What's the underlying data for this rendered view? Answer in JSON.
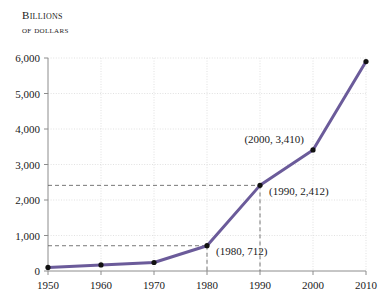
{
  "chart_data": {
    "type": "line",
    "title": "",
    "ylabel_line1": "Billions",
    "ylabel_line2": "of dollars",
    "xlabel": "",
    "x": [
      1950,
      1960,
      1970,
      1980,
      1990,
      2000,
      2010
    ],
    "values": [
      100,
      170,
      240,
      712,
      2412,
      3410,
      5900
    ],
    "series": [
      {
        "name": "Billions of dollars",
        "values": [
          100,
          170,
          240,
          712,
          2412,
          3410,
          5900
        ],
        "color": "#6B5B9A"
      }
    ],
    "x_tick_labels": [
      "1950",
      "1960",
      "1970",
      "1980",
      "1990",
      "2000",
      "2010"
    ],
    "y_tick_labels": [
      "0",
      "1,000",
      "2,000",
      "3,000",
      "4,000",
      "5,000",
      "6,000"
    ],
    "y_tick_values": [
      0,
      1000,
      2000,
      3000,
      4000,
      5000,
      6000
    ],
    "xlim": [
      1950,
      2010
    ],
    "ylim": [
      0,
      6000
    ],
    "grid": true,
    "grid_style": "dotted",
    "grid_color": "#d9d9d9",
    "axis_color": "#8c8c8c",
    "marker_color": "#111111",
    "legend": "none",
    "annotations": [
      {
        "label": "(1980, 712)",
        "x": 1980,
        "y": 712
      },
      {
        "label": "(1990, 2,412)",
        "x": 1990,
        "y": 2412
      },
      {
        "label": "(2000, 3,410)",
        "x": 2000,
        "y": 3410
      }
    ],
    "leader_lines": [
      {
        "type": "horizontal",
        "y": 712
      },
      {
        "type": "horizontal",
        "y": 2412
      },
      {
        "type": "vertical",
        "x": 1980
      },
      {
        "type": "vertical",
        "x": 1990
      }
    ]
  }
}
